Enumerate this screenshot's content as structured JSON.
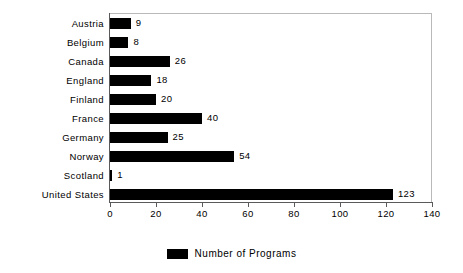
{
  "chart_data": {
    "type": "bar",
    "orientation": "horizontal",
    "title": "",
    "xlabel": "",
    "ylabel": "",
    "categories": [
      "Austria",
      "Belgium",
      "Canada",
      "England",
      "Finland",
      "France",
      "Germany",
      "Norway",
      "Scotland",
      "United States"
    ],
    "values": [
      9,
      8,
      26,
      18,
      20,
      40,
      25,
      54,
      1,
      123
    ],
    "value_labels": [
      "9",
      "8",
      "26",
      "18",
      "20",
      "40",
      "25",
      "54",
      "1",
      "123"
    ],
    "series": [
      {
        "name": "Number of Programs",
        "color": "#000000",
        "values": [
          9,
          8,
          26,
          18,
          20,
          40,
          25,
          54,
          1,
          123
        ]
      }
    ],
    "xlim": [
      0,
      140
    ],
    "x_ticks": [
      0,
      20,
      40,
      60,
      80,
      100,
      120,
      140
    ],
    "x_tick_labels": [
      "0",
      "20",
      "40",
      "60",
      "80",
      "100",
      "120",
      "140"
    ],
    "grid": false,
    "legend_position": "bottom",
    "legend_entries": [
      "Number of Programs"
    ],
    "bar_color": "#000000",
    "frame_color": "#b9b9b9",
    "axis_color": "#5a5a5a",
    "background": "#ffffff"
  },
  "legend": {
    "label": "Number of Programs"
  }
}
